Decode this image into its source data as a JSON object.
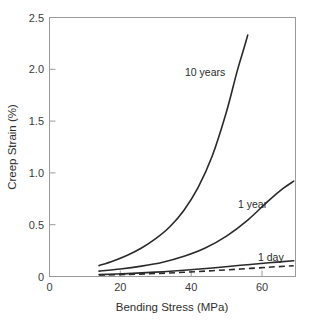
{
  "chart_data": {
    "type": "line",
    "title": "",
    "xlabel": "Bending Stress (MPa)",
    "ylabel": "Creep Strain (%)",
    "xlim": [
      0,
      69.5
    ],
    "ylim": [
      0,
      2.5
    ],
    "xticks": [
      0,
      20,
      40,
      60
    ],
    "xtick_labels": [
      "0",
      "20",
      "40",
      "60"
    ],
    "yticks": [
      0,
      0.5,
      1.0,
      1.5,
      2.0,
      2.5
    ],
    "ytick_labels": [
      "0",
      "0.5",
      "1.0",
      "1.5",
      "2.0",
      "2.5"
    ],
    "grid": false,
    "legend": "inline-annotations",
    "series": [
      {
        "name": "10 years",
        "style": "solid",
        "color": "#2a2a2a",
        "annotation": "10 years",
        "x": [
          14,
          18,
          22,
          26,
          30,
          34,
          38,
          42,
          46,
          50,
          53,
          55,
          56
        ],
        "y": [
          0.105,
          0.15,
          0.205,
          0.275,
          0.365,
          0.48,
          0.64,
          0.86,
          1.165,
          1.59,
          1.98,
          2.21,
          2.33
        ]
      },
      {
        "name": "1 year",
        "style": "solid",
        "color": "#2a2a2a",
        "annotation": "1 year",
        "x": [
          14,
          20,
          26,
          32,
          38,
          44,
          50,
          56,
          62,
          66,
          69
        ],
        "y": [
          0.052,
          0.072,
          0.1,
          0.138,
          0.195,
          0.275,
          0.39,
          0.545,
          0.735,
          0.85,
          0.92
        ]
      },
      {
        "name": "1 day",
        "style": "solid",
        "color": "#2a2a2a",
        "annotation": "1 day",
        "x": [
          14,
          22,
          30,
          38,
          46,
          54,
          62,
          69
        ],
        "y": [
          0.018,
          0.028,
          0.042,
          0.06,
          0.082,
          0.108,
          0.132,
          0.152
        ]
      },
      {
        "name": "dashed-lower",
        "style": "dashed",
        "color": "#2a2a2a",
        "annotation": "",
        "x": [
          14,
          22,
          30,
          38,
          46,
          54,
          62,
          69
        ],
        "y": [
          0.014,
          0.02,
          0.029,
          0.041,
          0.056,
          0.072,
          0.09,
          0.104
        ]
      }
    ],
    "annotations": [
      {
        "text": "10 years",
        "x_px": 185,
        "y_px": 76
      },
      {
        "text": "1 year",
        "x_px": 238,
        "y_px": 208
      },
      {
        "text": "1 day",
        "x_px": 258,
        "y_px": 261
      }
    ]
  },
  "axes": {
    "x_title": "Bending Stress (MPa)",
    "y_title": "Creep Strain (%)",
    "x_labels": [
      "0",
      "20",
      "40",
      "60"
    ],
    "y_labels": [
      "0",
      "0.5",
      "1.0",
      "1.5",
      "2.0",
      "2.5"
    ]
  },
  "colors": {
    "curve": "#2a2a2a",
    "frame": "#9b9b9b",
    "text": "#3b3b3b",
    "background": "#ffffff"
  }
}
